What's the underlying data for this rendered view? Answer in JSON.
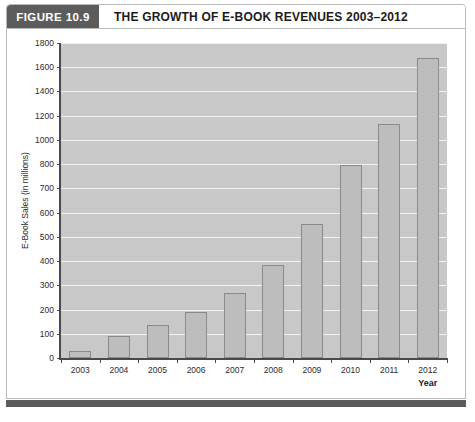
{
  "header": {
    "badge_label": "FIGURE 10.9",
    "title": "THE GROWTH OF E-BOOK REVENUES 2003–2012",
    "badge_color": "#5c5c5c",
    "title_color": "#1b1b1b"
  },
  "caption": {
    "text": ""
  },
  "chart_data": {
    "type": "bar",
    "title": "THE GROWTH OF E-BOOK REVENUES 2003–2012",
    "subtitle": "",
    "xlabel": "Year",
    "ylabel": "E-Book Sales (in millions)",
    "categories": [
      "2003",
      "2004",
      "2005",
      "2006",
      "2007",
      "2008",
      "2009",
      "2010",
      "2011",
      "2012"
    ],
    "values": [
      30,
      90,
      135,
      190,
      268,
      383,
      553,
      798,
      1130,
      1680
    ],
    "y_tick_labels": [
      "0",
      "100",
      "200",
      "300",
      "400",
      "500",
      "600",
      "700",
      "800",
      "1000",
      "1200",
      "1400",
      "1600",
      "1800"
    ],
    "y_tick_values": [
      0,
      100,
      200,
      300,
      400,
      500,
      600,
      700,
      800,
      1000,
      1200,
      1400,
      1600,
      1800
    ],
    "axis_note": "y-axis ticks are evenly spaced although step size changes from 100 to 200 above 800",
    "ylim": [
      0,
      1800
    ],
    "grid": true,
    "grid_color": "#f2f2f2",
    "legend": false,
    "legend_position": "none",
    "plot_background": "#c8c8c8",
    "bar_fill": "#bdbdbd",
    "bar_border": "#8a8a8a",
    "axis_color": "#4a4a4a"
  }
}
